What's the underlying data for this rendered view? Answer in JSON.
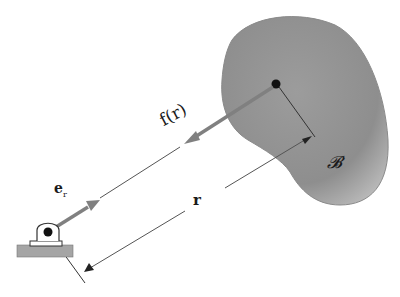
{
  "diagram": {
    "body_label": "𝓑",
    "force_label": "f(r)",
    "distance_label": "r",
    "unit_vector_label": "e",
    "unit_vector_subscript": "r",
    "colors": {
      "body_fill": "#9a9a9a",
      "body_edge": "#707070",
      "line": "#555555",
      "arrow": "#7a7a7a",
      "point": "#111111",
      "base": "#a9a9a9"
    }
  }
}
